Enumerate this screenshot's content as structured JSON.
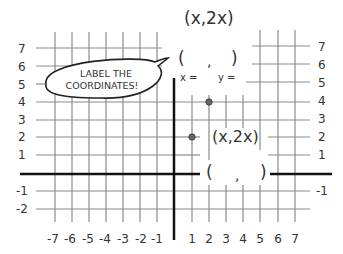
{
  "title_formula": "(x,2x)",
  "bubble": {
    "line1": "LABEL THE",
    "line2": "COORDINATES!"
  },
  "top_point": {
    "blank": {
      "open": "(",
      "comma": ",",
      "close": ")"
    },
    "x_label": "x =",
    "y_label": "y =",
    "coords": [
      2,
      4
    ]
  },
  "bottom_point": {
    "formula": "(x,2x)",
    "blank": {
      "open": "(",
      "comma": ",",
      "close": ")"
    },
    "coords": [
      1,
      2
    ]
  },
  "axes": {
    "x_ticks": [
      "-7",
      "-6",
      "-5",
      "-4",
      "-3",
      "-2",
      "-1",
      "1",
      "2",
      "3",
      "4",
      "5",
      "6",
      "7"
    ],
    "y_ticks_left": [
      "7",
      "6",
      "5",
      "4",
      "3",
      "2",
      "1",
      "-1",
      "-2"
    ],
    "y_ticks_right": [
      "7",
      "6",
      "5",
      "4",
      "3",
      "2",
      "1",
      "-1"
    ]
  },
  "colors": {
    "grid": "#8a8a8a",
    "axis": "#111111",
    "point": "#666666",
    "text": "#333333"
  }
}
